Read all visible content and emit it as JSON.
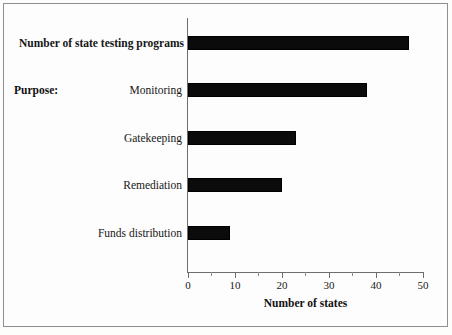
{
  "chart_data": {
    "type": "bar",
    "orientation": "horizontal",
    "title": "",
    "xlabel": "Number of states",
    "ylabel": "",
    "xlim": [
      0,
      50
    ],
    "xticks": [
      0,
      10,
      20,
      30,
      40,
      50
    ],
    "xtick_labels": [
      "0",
      "10",
      "20",
      "30",
      "40",
      "50"
    ],
    "minor_xticks": [
      5,
      15,
      25,
      35,
      45
    ],
    "grid": false,
    "legend": null,
    "bar_color": "#000000",
    "categories": [
      "Number of state testing programs",
      "Monitoring",
      "Gatekeeping",
      "Remediation",
      "Funds distribution"
    ],
    "values": [
      47,
      38,
      23,
      20,
      9
    ],
    "bars": [
      {
        "label": "Number of state testing programs",
        "value": 47,
        "bold": true
      },
      {
        "label": "Monitoring",
        "value": 38,
        "bold": false
      },
      {
        "label": "Gatekeeping",
        "value": 23,
        "bold": false
      },
      {
        "label": "Remediation",
        "value": 20,
        "bold": false
      },
      {
        "label": "Funds distribution",
        "value": 9,
        "bold": false
      }
    ],
    "annotations": [
      {
        "name": "purpose-group-label",
        "text": "Purpose:"
      }
    ]
  },
  "labels": {
    "purpose": "Purpose:",
    "bar0": "Number of state testing programs",
    "bar1": "Monitoring",
    "bar2": "Gatekeeping",
    "bar3": "Remediation",
    "bar4": "Funds distribution",
    "xaxis_title": "Number of states",
    "tick0": "0",
    "tick1": "10",
    "tick2": "20",
    "tick3": "30",
    "tick4": "40",
    "tick5": "50"
  }
}
